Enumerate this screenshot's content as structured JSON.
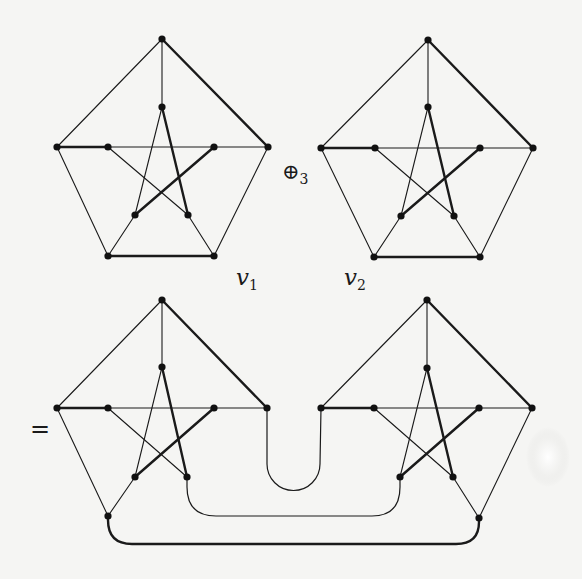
{
  "figure": {
    "operator_label": "⊕",
    "operator_sub": "3",
    "equals_label": "=",
    "vertex_labels": [
      {
        "name": "v",
        "sub": "1"
      },
      {
        "name": "v",
        "sub": "2"
      }
    ],
    "colors": {
      "line": "#1a1a1a",
      "background": "#f5f5f3"
    }
  },
  "graphs": {
    "top_left": {
      "vertices": {
        "top": [
          162,
          39
        ],
        "itop": [
          162,
          107
        ],
        "left": [
          57,
          147
        ],
        "ileft": [
          108,
          147
        ],
        "iright": [
          214,
          147
        ],
        "right": [
          268,
          147
        ],
        "ibl": [
          135,
          215
        ],
        "ibr": [
          188,
          215
        ],
        "bl": [
          108,
          256
        ],
        "br": [
          214,
          256
        ]
      }
    },
    "top_right": {
      "vertices": {
        "top": [
          428,
          40
        ],
        "itop": [
          428,
          107
        ],
        "left": [
          321,
          148
        ],
        "ileft": [
          375,
          148
        ],
        "iright": [
          480,
          148
        ],
        "right": [
          533,
          148
        ],
        "ibl": [
          401,
          216
        ],
        "ibr": [
          454,
          216
        ],
        "bl": [
          374,
          257
        ],
        "br": [
          480,
          257
        ]
      }
    },
    "bottom_left": {
      "vertices": {
        "top": [
          162,
          300
        ],
        "itop": [
          162,
          367
        ],
        "left": [
          57,
          408
        ],
        "ileft": [
          108,
          408
        ],
        "iright": [
          214,
          408
        ],
        "right": [
          267,
          408
        ],
        "ibl": [
          135,
          477
        ],
        "ibr": [
          187,
          477
        ],
        "bl": [
          108,
          516
        ]
      }
    },
    "bottom_right": {
      "vertices": {
        "top": [
          427,
          300
        ],
        "itop": [
          427,
          368
        ],
        "left": [
          321,
          408
        ],
        "ileft": [
          374,
          408
        ],
        "iright": [
          479,
          408
        ],
        "right": [
          532,
          408
        ],
        "ibl": [
          400,
          477
        ],
        "ibr": [
          453,
          477
        ],
        "br": [
          479,
          518
        ]
      }
    }
  }
}
